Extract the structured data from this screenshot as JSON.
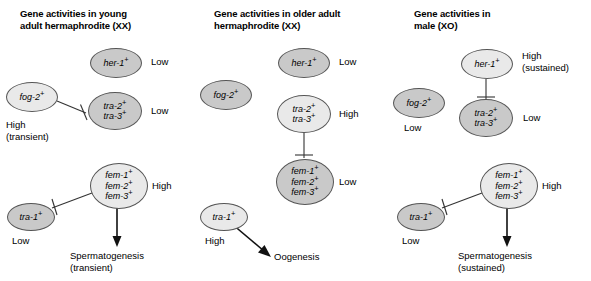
{
  "figure": {
    "background_color": "#ffffff",
    "node_fill_high": "#e9e9e9",
    "node_fill_low": "#c9c9c9",
    "node_stroke": "#555555"
  },
  "panels": [
    {
      "id": "young-adult-hermaphrodite",
      "title": "Gene activities in young\nadult hermaphrodite (XX)",
      "nodes": [
        {
          "name": "her-1",
          "genes": [
            "her-1"
          ],
          "state": "low",
          "level": "Low"
        },
        {
          "name": "fog-2",
          "genes": [
            "fog-2"
          ],
          "state": "high",
          "level": "High\n(transient)"
        },
        {
          "name": "tra-2-tra-3",
          "genes": [
            "tra-2",
            "tra-3"
          ],
          "state": "low",
          "level": "Low"
        },
        {
          "name": "fem-1-fem-2-fem-3",
          "genes": [
            "fem-1",
            "fem-2",
            "fem-3"
          ],
          "state": "high",
          "level": "High"
        },
        {
          "name": "tra-1",
          "genes": [
            "tra-1"
          ],
          "state": "low",
          "level": "Low"
        }
      ],
      "outcome": "Spermatogenesis\n(transient)",
      "edges": [
        {
          "from": "fog-2",
          "to": "tra-2-tra-3",
          "type": "inhibition"
        },
        {
          "from": "fem-1-fem-2-fem-3",
          "to": "tra-1",
          "type": "inhibition"
        },
        {
          "from": "fem-1-fem-2-fem-3",
          "to": "outcome",
          "type": "activation"
        }
      ]
    },
    {
      "id": "older-adult-hermaphrodite",
      "title": "Gene activities in older adult\nhermaphrodite (XX)",
      "nodes": [
        {
          "name": "her-1",
          "genes": [
            "her-1"
          ],
          "state": "low",
          "level": "Low"
        },
        {
          "name": "fog-2",
          "genes": [
            "fog-2"
          ],
          "state": "low",
          "level": ""
        },
        {
          "name": "tra-2-tra-3",
          "genes": [
            "tra-2",
            "tra-3"
          ],
          "state": "high",
          "level": "High"
        },
        {
          "name": "fem-1-fem-2-fem-3",
          "genes": [
            "fem-1",
            "fem-2",
            "fem-3"
          ],
          "state": "low",
          "level": "Low"
        },
        {
          "name": "tra-1",
          "genes": [
            "tra-1"
          ],
          "state": "high",
          "level": "High"
        }
      ],
      "outcome": "Oogenesis",
      "edges": [
        {
          "from": "tra-2-tra-3",
          "to": "fem-1-fem-2-fem-3",
          "type": "inhibition"
        },
        {
          "from": "tra-1",
          "to": "outcome",
          "type": "activation"
        }
      ]
    },
    {
      "id": "male",
      "title": "Gene activities in\nmale (XO)",
      "nodes": [
        {
          "name": "her-1",
          "genes": [
            "her-1"
          ],
          "state": "high",
          "level": "High\n(sustained)"
        },
        {
          "name": "fog-2",
          "genes": [
            "fog-2"
          ],
          "state": "low",
          "level": "Low"
        },
        {
          "name": "tra-2-tra-3",
          "genes": [
            "tra-2",
            "tra-3"
          ],
          "state": "low",
          "level": "Low"
        },
        {
          "name": "fem-1-fem-2-fem-3",
          "genes": [
            "fem-1",
            "fem-2",
            "fem-3"
          ],
          "state": "high",
          "level": "High"
        },
        {
          "name": "tra-1",
          "genes": [
            "tra-1"
          ],
          "state": "low",
          "level": "Low"
        }
      ],
      "outcome": "Spermatogenesis\n(sustained)",
      "edges": [
        {
          "from": "her-1",
          "to": "tra-2-tra-3",
          "type": "inhibition"
        },
        {
          "from": "fem-1-fem-2-fem-3",
          "to": "tra-1",
          "type": "inhibition"
        },
        {
          "from": "fem-1-fem-2-fem-3",
          "to": "outcome",
          "type": "activation"
        }
      ]
    }
  ]
}
